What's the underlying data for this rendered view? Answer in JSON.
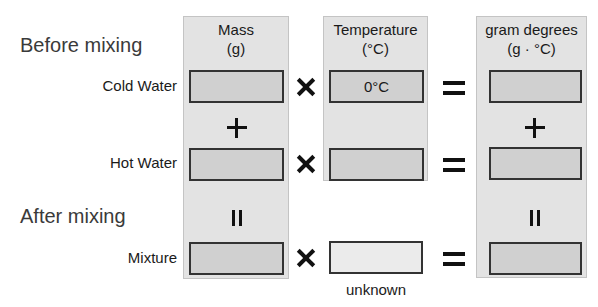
{
  "sections": {
    "before": "Before mixing",
    "after": "After mixing"
  },
  "columns": {
    "mass": {
      "title": "Mass",
      "unit": "(g)"
    },
    "temperature": {
      "title": "Temperature",
      "unit": "(°C)"
    },
    "gram_degrees": {
      "title": "gram degrees",
      "unit": "(g · °C)"
    }
  },
  "rows": {
    "cold": {
      "label": "Cold Water",
      "mass": "",
      "temperature": "0°C",
      "gram_degrees": ""
    },
    "hot": {
      "label": "Hot Water",
      "mass": "",
      "temperature": "",
      "gram_degrees": ""
    },
    "mixture": {
      "label": "Mixture",
      "mass": "",
      "temperature": "",
      "gram_degrees": "",
      "temperature_caption": "unknown"
    }
  },
  "operators": {
    "multiply": "×",
    "equals": "=",
    "plus": "+",
    "rotated_equals": "||"
  },
  "colors": {
    "panel": "#e3e3e3",
    "box": "#d0d0d0",
    "unknown_box": "#ebebeb",
    "border": "#333333"
  }
}
